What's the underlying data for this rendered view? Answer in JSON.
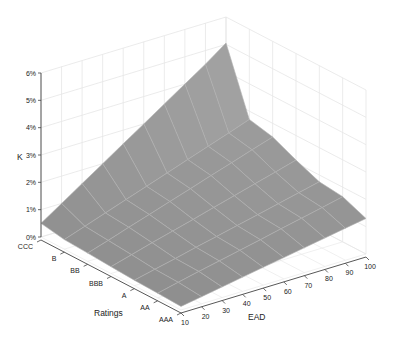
{
  "chart_data": {
    "type": "surface3d",
    "title": "",
    "xlabel": "EAD",
    "ylabel": "Ratings",
    "zlabel": "K",
    "x": [
      10,
      20,
      30,
      40,
      50,
      60,
      70,
      80,
      90,
      100
    ],
    "x_ticks": [
      "10",
      "20",
      "30",
      "40",
      "50",
      "60",
      "70",
      "80",
      "90",
      "100"
    ],
    "y_categories": [
      "CCC",
      "B",
      "BB",
      "BBB",
      "A",
      "AA",
      "AAA"
    ],
    "z_ticks": [
      "0%",
      "1%",
      "2%",
      "3%",
      "4%",
      "5%",
      "6%"
    ],
    "zlim": [
      0,
      6
    ],
    "z_unit": "%",
    "grid": true,
    "series": [
      {
        "name": "CCC",
        "values": [
          0.5,
          1.0,
          1.5,
          2.0,
          2.5,
          3.0,
          3.5,
          4.0,
          4.5,
          5.05
        ]
      },
      {
        "name": "B",
        "values": [
          0.35,
          0.61,
          0.87,
          1.13,
          1.39,
          1.65,
          1.91,
          2.17,
          2.43,
          2.7
        ]
      },
      {
        "name": "BB",
        "values": [
          0.3,
          0.54,
          0.79,
          1.03,
          1.28,
          1.52,
          1.77,
          2.01,
          2.26,
          2.5
        ]
      },
      {
        "name": "BBB",
        "values": [
          0.25,
          0.46,
          0.67,
          0.87,
          1.07,
          1.28,
          1.48,
          1.69,
          1.89,
          2.1
        ]
      },
      {
        "name": "A",
        "values": [
          0.2,
          0.37,
          0.54,
          0.72,
          0.89,
          1.06,
          1.23,
          1.4,
          1.58,
          1.75
        ]
      },
      {
        "name": "AA",
        "values": [
          0.17,
          0.34,
          0.51,
          0.67,
          0.83,
          0.99,
          1.16,
          1.32,
          1.48,
          1.65
        ]
      },
      {
        "name": "AAA",
        "values": [
          0.13,
          0.26,
          0.39,
          0.52,
          0.65,
          0.78,
          0.91,
          1.04,
          1.17,
          1.3
        ]
      }
    ],
    "colors": {
      "surface": "#8e8e8e",
      "surface_high": "#a3a3a3",
      "surface_grid": "#b0b0b0",
      "axis": "#444444",
      "back_grid": "#e6e6e6"
    }
  }
}
